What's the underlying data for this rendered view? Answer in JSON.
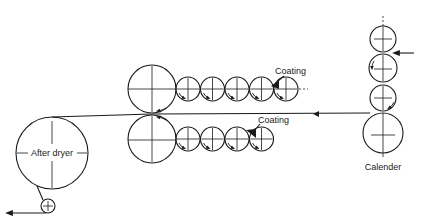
{
  "diagram": {
    "type": "paper-machine-web-path",
    "labels": {
      "coating_top": "Coating",
      "coating_bottom": "Coating",
      "calender": "Calender",
      "after_dryer": "After dryer"
    },
    "sections": [
      {
        "name": "calender-stack",
        "rolls": 4,
        "web_direction": "in-from-right"
      },
      {
        "name": "top-coater",
        "large_rolls": 1,
        "small_rolls": 5
      },
      {
        "name": "bottom-coater",
        "large_rolls": 1,
        "small_rolls": 4
      },
      {
        "name": "after-dryer",
        "rolls": 1,
        "exit_roll": 1,
        "web_direction": "out-to-left"
      }
    ],
    "colors": {
      "line": "#1a1a1a",
      "background": "#ffffff"
    }
  }
}
